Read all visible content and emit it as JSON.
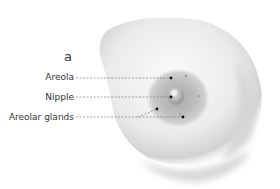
{
  "figure": {
    "panel_letter": "a",
    "labels": [
      {
        "id": "areola",
        "text": "Areola"
      },
      {
        "id": "nipple",
        "text": "Nipple"
      },
      {
        "id": "areolar-glands",
        "text": "Areolar glands"
      }
    ]
  },
  "colors": {
    "text": "#333333",
    "leader_line": "#666666",
    "dot": "#111111",
    "skin_light": "#f4f4f4",
    "skin_shade": "#cfcfcf",
    "areola": "#b9b9b9",
    "nipple": "#a8a8a8"
  }
}
